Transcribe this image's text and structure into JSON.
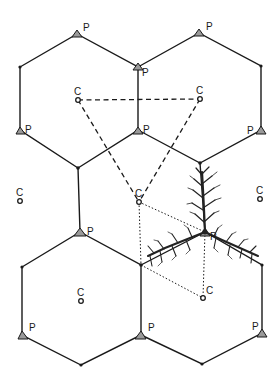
{
  "figure": {
    "labels": {
      "center": "C",
      "vertex": "P"
    },
    "colors": {
      "line": "#1a1a1a",
      "triangle_fill": "#9a9a9a",
      "background": "#ffffff"
    },
    "centers": [
      {
        "id": "c1",
        "x": 78,
        "y": 100,
        "label": "C"
      },
      {
        "id": "c2",
        "x": 200,
        "y": 99,
        "label": "C"
      },
      {
        "id": "c3",
        "x": 20,
        "y": 201,
        "label": "C"
      },
      {
        "id": "c4",
        "x": 139,
        "y": 202,
        "label": "C"
      },
      {
        "id": "c5",
        "x": 260,
        "y": 199,
        "label": "C"
      },
      {
        "id": "c6",
        "x": 81,
        "y": 301,
        "label": "C"
      },
      {
        "id": "c7",
        "x": 203,
        "y": 298,
        "label": "C"
      }
    ],
    "p_vertices": [
      {
        "id": "p1",
        "x": 77,
        "y": 34,
        "label": "P",
        "lx": 83,
        "ly": 30
      },
      {
        "id": "p2",
        "x": 199,
        "y": 33,
        "label": "P",
        "lx": 206,
        "ly": 29
      },
      {
        "id": "p3",
        "x": 138,
        "y": 67,
        "label": "P",
        "lx": 142,
        "ly": 75
      },
      {
        "id": "p4",
        "x": 20,
        "y": 130,
        "label": "P",
        "lx": 26,
        "ly": 134
      },
      {
        "id": "p5",
        "x": 138,
        "y": 130,
        "label": "P",
        "lx": 144,
        "ly": 134
      },
      {
        "id": "p6",
        "x": 261,
        "y": 130,
        "label": "P",
        "lx": 247,
        "ly": 134
      },
      {
        "id": "p7",
        "x": 80,
        "y": 232,
        "label": "P",
        "lx": 87,
        "ly": 234
      },
      {
        "id": "p8",
        "x": 205,
        "y": 232,
        "label": "P",
        "lx": 210,
        "ly": 236
      },
      {
        "id": "p9",
        "x": 22,
        "y": 335,
        "label": "P",
        "lx": 29,
        "ly": 331
      },
      {
        "id": "p10",
        "x": 141,
        "y": 335,
        "label": "P",
        "lx": 148,
        "ly": 331
      },
      {
        "id": "p11",
        "x": 262,
        "y": 333,
        "label": "P",
        "lx": 253,
        "ly": 329
      }
    ]
  }
}
